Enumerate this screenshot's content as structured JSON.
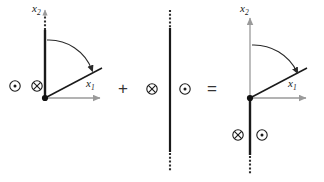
{
  "figure": {
    "type": "vector-decomposition-diagram",
    "colors": {
      "line_black": "#1a1a1a",
      "axis_gray": "#9a9a9a",
      "text": "#1a1a1a",
      "operator": "#333333",
      "background": "#ffffff"
    }
  },
  "operators": {
    "plus": "+",
    "equals": "="
  },
  "panels": [
    {
      "id": "panel-left",
      "name": "left-diagram",
      "origin": {
        "x": 45,
        "y": 98
      },
      "axes": [
        {
          "name": "x2-axis",
          "label": "x",
          "sub": "2",
          "style": "dotted",
          "direction": "up",
          "label_x": 33,
          "label_y": 4
        },
        {
          "name": "x1-axis",
          "label": "x",
          "sub": "1",
          "style": "solid-gray",
          "direction": "right",
          "label_x": 88,
          "label_y": 80
        }
      ],
      "vertical_line": {
        "name": "slip-plane-line",
        "style": "solid-black",
        "from_y": 32,
        "to_y": 98
      },
      "dotted_extension": {
        "name": "dotted-extension-top",
        "from_y": 8,
        "to_y": 32
      },
      "diagonal_line": {
        "name": "rotated-slip-line",
        "angle_deg": 28,
        "length": 58
      },
      "rotation_arrow": {
        "name": "rotation-arc-arrow",
        "direction": "clockwise"
      },
      "symbols": [
        {
          "name": "dot-circle-symbol",
          "glyph": "out-of-page",
          "x": 15,
          "y": 86
        },
        {
          "name": "cross-circle-symbol",
          "glyph": "into-page",
          "x": 37,
          "y": 86
        }
      ],
      "origin_dot": {
        "name": "origin-node",
        "x": 45,
        "y": 98
      }
    },
    {
      "id": "panel-middle",
      "name": "middle-diagram",
      "vertical_line": {
        "name": "full-slip-plane-line",
        "style": "solid-black",
        "x": 170,
        "from_y": 28,
        "to_y": 152
      },
      "dotted_extensions": [
        {
          "name": "dotted-extension-top",
          "from_y": 10,
          "to_y": 28
        },
        {
          "name": "dotted-extension-bottom",
          "from_y": 152,
          "to_y": 172
        }
      ],
      "symbols": [
        {
          "name": "cross-circle-symbol",
          "glyph": "into-page",
          "x": 152,
          "y": 89
        },
        {
          "name": "dot-circle-symbol",
          "glyph": "out-of-page",
          "x": 185,
          "y": 89
        }
      ]
    },
    {
      "id": "panel-right",
      "name": "right-diagram",
      "origin": {
        "x": 250,
        "y": 98
      },
      "axes": [
        {
          "name": "x2-axis",
          "label": "x",
          "sub": "2",
          "style": "solid-gray",
          "direction": "up",
          "label_x": 241,
          "label_y": 4
        },
        {
          "name": "x1-axis",
          "label": "x",
          "sub": "1",
          "style": "solid-gray",
          "direction": "right",
          "label_x": 290,
          "label_y": 80
        }
      ],
      "vertical_line": {
        "name": "slip-plane-line",
        "style": "solid-black",
        "from_y": 98,
        "to_y": 155
      },
      "dotted_extension": {
        "name": "dotted-extension-bottom",
        "from_y": 155,
        "to_y": 174
      },
      "diagonal_line": {
        "name": "rotated-slip-line",
        "angle_deg": 28,
        "length": 58
      },
      "rotation_arrow": {
        "name": "rotation-arc-arrow",
        "direction": "clockwise"
      },
      "symbols": [
        {
          "name": "cross-circle-symbol",
          "glyph": "into-page",
          "x": 238,
          "y": 135
        },
        {
          "name": "dot-circle-symbol",
          "glyph": "out-of-page",
          "x": 261,
          "y": 135
        }
      ],
      "origin_dot": {
        "name": "origin-node",
        "x": 250,
        "y": 98
      }
    }
  ]
}
